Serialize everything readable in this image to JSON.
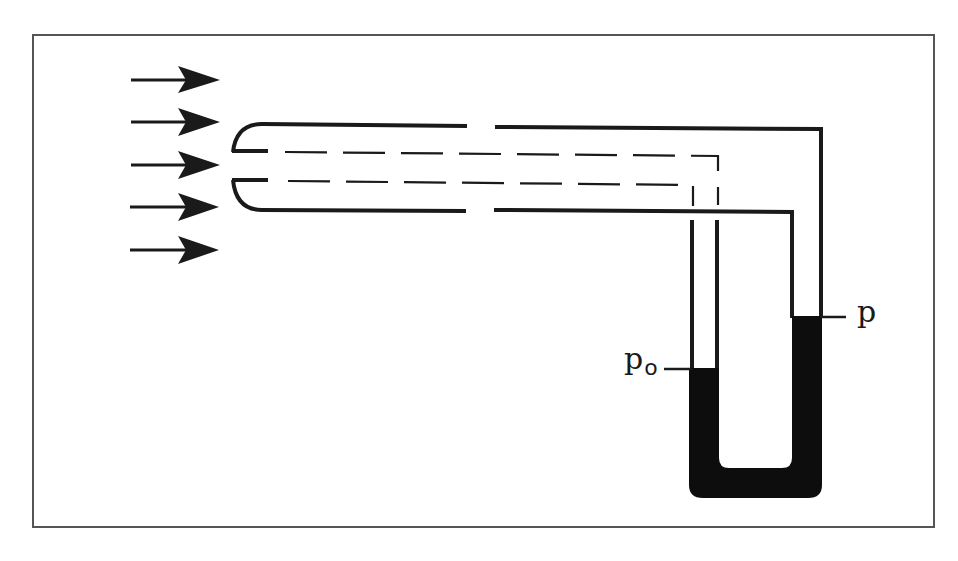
{
  "figure": {
    "colors": {
      "line": "#1a1a1a",
      "frame": "#555555",
      "fluid": "#0d0d0d",
      "background": "#ffffff"
    }
  },
  "labels": {
    "static_pressure": "p",
    "stagnation_pressure_base": "p",
    "stagnation_pressure_sub": "o"
  },
  "flow": {
    "arrow_count": 5,
    "direction": "right"
  }
}
